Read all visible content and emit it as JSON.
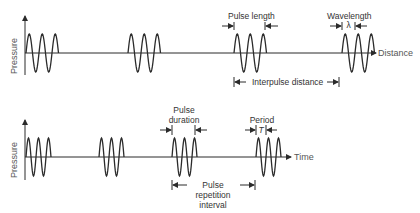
{
  "colors": {
    "ink": "#2b2b2b",
    "text": "#333333",
    "axis_text": "#555555",
    "background": "#ffffff"
  },
  "top_panel": {
    "y_axis_label": "Pressure",
    "x_axis_label": "Distance",
    "annotations": {
      "pulse_length": "Pulse length",
      "wavelength": "Wavelength",
      "wavelength_symbol": "λ",
      "interpulse_distance": "Interpulse distance"
    },
    "pulse_count": 4,
    "cycles_per_pulse": 2.5
  },
  "bottom_panel": {
    "y_axis_label": "Pressure",
    "x_axis_label": "Time",
    "annotations": {
      "pulse_duration_line1": "Pulse",
      "pulse_duration_line2": "duration",
      "period": "Period",
      "period_symbol": "T",
      "pri_line1": "Pulse",
      "pri_line2": "repetition",
      "pri_line3": "interval"
    },
    "pulse_count": 4,
    "cycles_per_pulse": 2.5
  }
}
